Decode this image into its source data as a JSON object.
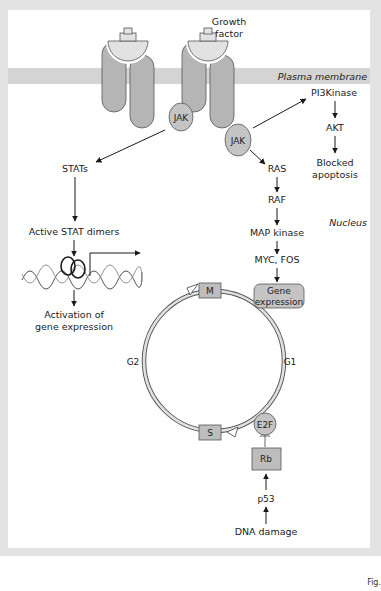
{
  "figure": {
    "labels": {
      "growth_factor_line1": "Growth",
      "growth_factor_line2": "factor",
      "plasma_membrane": "Plasma membrane",
      "nucleus": "Nucleus",
      "jak_left": "JAK",
      "jak_right": "JAK",
      "pi3kinase": "PI3Kinase",
      "akt": "AKT",
      "blocked_line1": "Blocked",
      "blocked_line2": "apoptosis",
      "stats": "STATs",
      "active_stat_dimers": "Active STAT dimers",
      "activation_line1": "Activation of",
      "activation_line2": "gene expression",
      "ras": "RAS",
      "raf": "RAF",
      "map_kinase": "MAP kinase",
      "myc_fos": "MYC, FOS",
      "gene_expr_line1": "Gene",
      "gene_expr_line2": "expression",
      "phase_m": "M",
      "phase_s": "S",
      "phase_g1": "G1",
      "phase_g2": "G2",
      "e2f": "E2F",
      "rb": "Rb",
      "p53": "p53",
      "dna_damage": "DNA damage",
      "fig_caption": "Fig."
    },
    "colors": {
      "frame_gray": "#e3e3e3",
      "membrane_band": "#d4d4d4",
      "receptor_fill": "#b5b5b5",
      "protein_fill": "#c4c4c4",
      "box_fill": "#bdbdbd",
      "outline": "#555555",
      "arrow": "#1a1a1a",
      "cycle_fill": "#e0e0e0"
    }
  }
}
